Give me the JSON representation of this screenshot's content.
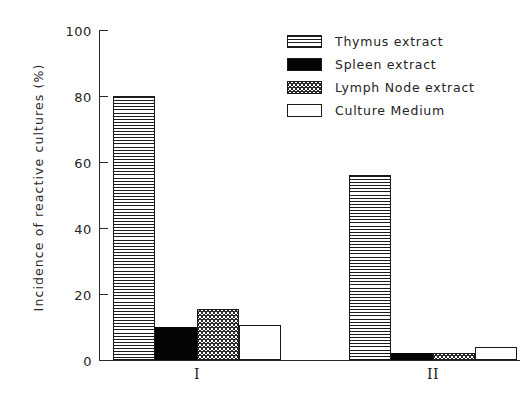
{
  "chart_data": {
    "type": "bar",
    "title": "",
    "xlabel": "",
    "ylabel": "Incidence of reactive cultures (%)",
    "categories": [
      "I",
      "II"
    ],
    "ylim": [
      0,
      100
    ],
    "yticks": [
      0,
      20,
      40,
      60,
      80,
      100
    ],
    "ytick_labels": [
      "0",
      "20",
      "40",
      "60",
      "80",
      "100"
    ],
    "grid": false,
    "legend_position": "top-right",
    "series": [
      {
        "name": "Thymus extract",
        "pattern": "horizontal-lines",
        "values": [
          80,
          56
        ]
      },
      {
        "name": "Spleen extract",
        "pattern": "solid-black",
        "values": [
          10,
          2
        ]
      },
      {
        "name": "Lymph Node extract",
        "pattern": "stippled",
        "values": [
          15.5,
          2
        ]
      },
      {
        "name": "Culture Medium",
        "pattern": "white-outline",
        "values": [
          10.5,
          4
        ]
      }
    ]
  },
  "axis": {
    "y_title": "Incidence of reactive cultures (%)",
    "tick_labels": [
      "100",
      "80",
      "60",
      "40",
      "20",
      "0"
    ],
    "group_labels": [
      "I",
      "II"
    ]
  },
  "legend": {
    "items": [
      {
        "label": "Thymus extract",
        "swatch": "swatch-horizontal-lines"
      },
      {
        "label": "Spleen extract",
        "swatch": "swatch-solid-black"
      },
      {
        "label": "Lymph Node extract",
        "swatch": "swatch-stippled"
      },
      {
        "label": "Culture Medium",
        "swatch": "swatch-white-outline"
      }
    ]
  },
  "colors": {
    "ink": "#1b1b1b",
    "axis": "#2a2a2a",
    "fill_black": "#050505",
    "background": "#ffffff"
  }
}
